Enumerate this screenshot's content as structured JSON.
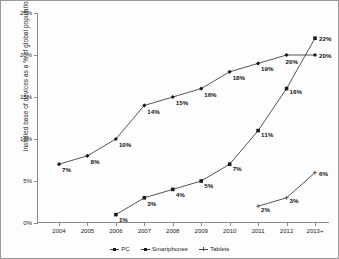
{
  "chart_data": {
    "type": "line",
    "title": "",
    "xlabel": "",
    "ylabel": "Installed base of devices as a % of global population",
    "categories": [
      "2004",
      "2005",
      "2006",
      "2007",
      "2008",
      "2009",
      "2010",
      "2011",
      "2012",
      "2013+"
    ],
    "ylim": [
      0,
      25
    ],
    "ytick_labels": [
      "0%",
      "5%",
      "10%",
      "15%",
      "20%",
      "25%"
    ],
    "ytick_values": [
      0,
      5,
      10,
      15,
      20,
      25
    ],
    "grid": false,
    "legend_position": "bottom-center",
    "series": [
      {
        "name": "PC",
        "marker": "diamond",
        "x": [
          "2004",
          "2005",
          "2006",
          "2007",
          "2008",
          "2009",
          "2010",
          "2011",
          "2012",
          "2013+"
        ],
        "values": [
          7,
          8,
          10,
          14,
          15,
          16,
          18,
          19,
          20,
          20
        ],
        "labels": [
          "7%",
          "8%",
          "10%",
          "14%",
          "15%",
          "16%",
          "18%",
          "19%",
          "20%",
          "20%"
        ]
      },
      {
        "name": "Smartphones",
        "marker": "square",
        "x": [
          "2006",
          "2007",
          "2008",
          "2009",
          "2010",
          "2011",
          "2012",
          "2013+"
        ],
        "values": [
          1,
          3,
          4,
          5,
          7,
          11,
          16,
          22
        ],
        "labels": [
          "1%",
          "3%",
          "4%",
          "5%",
          "7%",
          "11%",
          "16%",
          "22%"
        ]
      },
      {
        "name": "Tablets",
        "marker": "cross",
        "x": [
          "2011",
          "2012",
          "2013+"
        ],
        "values": [
          2,
          3,
          6
        ],
        "labels": [
          "2%",
          "3%",
          "6%"
        ]
      }
    ]
  },
  "axis": {
    "y_title": "Installed base of devices as a % of global population"
  },
  "legend": {
    "items": [
      {
        "label": "PC"
      },
      {
        "label": "Smartphones"
      },
      {
        "label": "Tablets"
      }
    ]
  }
}
